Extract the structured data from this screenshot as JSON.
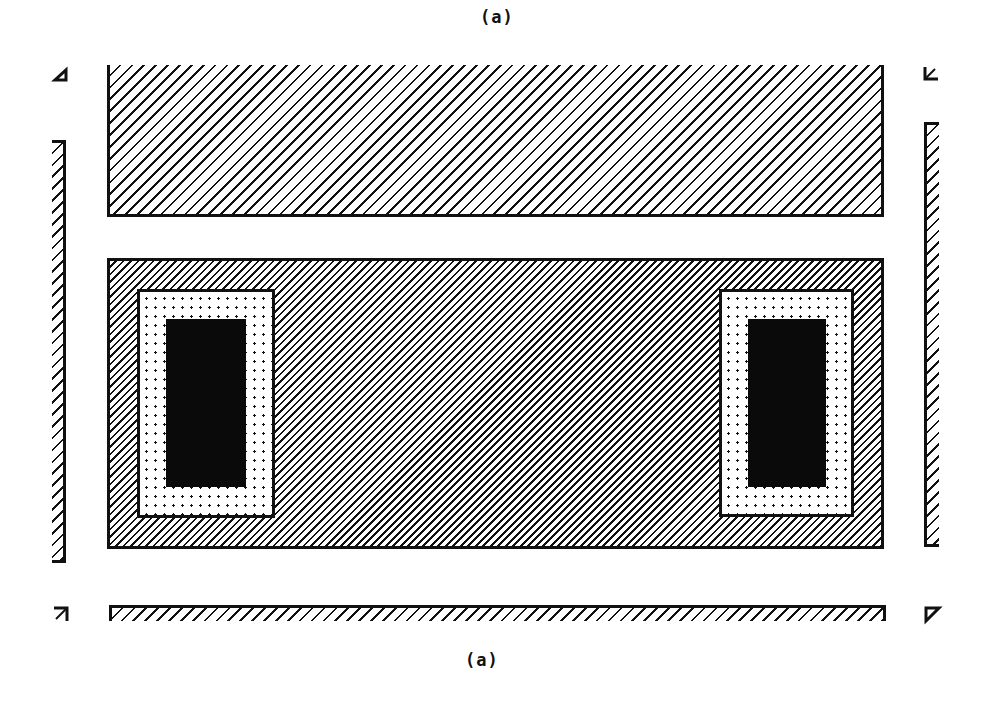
{
  "diagram": {
    "top_label": "(a)",
    "bottom_label": "(a)",
    "colors": {
      "stroke": "#111111",
      "fill_solid": "#0a0a0a",
      "background": "#ffffff"
    },
    "regions": [
      {
        "id": "top-block",
        "pattern": "sparse-diagonal-hatch",
        "note": "open top edge"
      },
      {
        "id": "middle-block",
        "pattern": "dense-diagonal-hatch"
      },
      {
        "id": "left-contact-ring",
        "pattern": "dot-fill"
      },
      {
        "id": "left-contact-core",
        "pattern": "solid-black"
      },
      {
        "id": "right-contact-ring",
        "pattern": "dot-fill"
      },
      {
        "id": "right-contact-core",
        "pattern": "solid-black"
      },
      {
        "id": "left-strip",
        "pattern": "sparse-diagonal-hatch",
        "note": "open right edge"
      },
      {
        "id": "right-strip",
        "pattern": "sparse-diagonal-hatch",
        "note": "open left side lines"
      },
      {
        "id": "bottom-strip",
        "pattern": "sparse-diagonal-hatch",
        "note": "open bottom edge"
      }
    ],
    "corner_marks": [
      "top-left",
      "top-right",
      "bottom-left",
      "bottom-right"
    ]
  }
}
